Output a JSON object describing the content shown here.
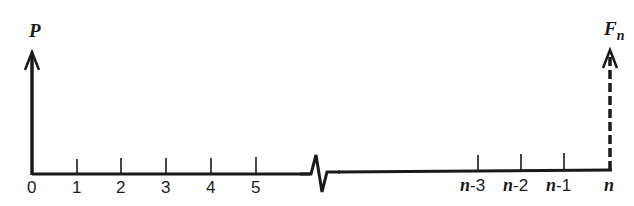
{
  "diagram": {
    "type": "cash-flow-timeline",
    "colors": {
      "line": "#1a1a1a",
      "background": "#ffffff"
    },
    "present_value": {
      "label": "P",
      "period": "0",
      "style": "solid-arrow-up"
    },
    "future_value": {
      "label": "F",
      "subscript": "n",
      "period": "n",
      "style": "dashed-arrow-up"
    },
    "axis_break": {
      "between": [
        "5",
        "n-3"
      ],
      "style": "zigzag"
    },
    "ticks": [
      {
        "label": "0",
        "x": 32
      },
      {
        "label": "1",
        "x": 77
      },
      {
        "label": "2",
        "x": 121
      },
      {
        "label": "3",
        "x": 166
      },
      {
        "label": "4",
        "x": 211
      },
      {
        "label": "5",
        "x": 256
      },
      {
        "prefix": "n",
        "suffix": "-3",
        "x": 478
      },
      {
        "prefix": "n",
        "suffix": "-2",
        "x": 521
      },
      {
        "prefix": "n",
        "suffix": "-1",
        "x": 564
      },
      {
        "prefix": "n",
        "suffix": "",
        "x": 610
      }
    ]
  }
}
